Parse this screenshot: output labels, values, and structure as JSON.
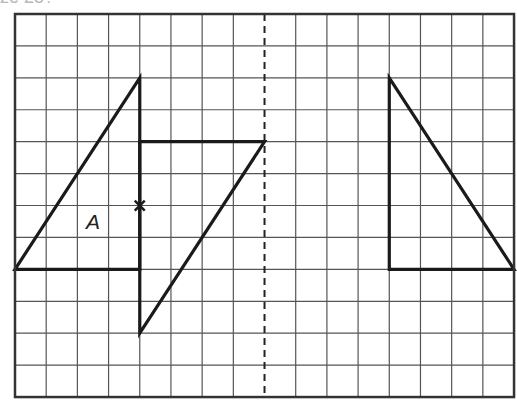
{
  "header": {
    "cropped_text": "ze 25?"
  },
  "grid": {
    "origin": [
      15,
      14
    ],
    "cols": 16,
    "rows": 12,
    "cell_w": 31.19,
    "cell_h": 31.92,
    "line_color": "#555555",
    "border_color": "#333333"
  },
  "mirror_line": {
    "col": 8,
    "style": "dashed",
    "color": "#222222"
  },
  "shapes": [
    {
      "id": "triangle-a",
      "points": [
        [
          0,
          8
        ],
        [
          4,
          2
        ],
        [
          4,
          8
        ]
      ],
      "closed": true
    },
    {
      "id": "image-triangle",
      "points": [
        [
          4,
          4
        ],
        [
          8,
          4
        ],
        [
          4,
          10
        ]
      ],
      "closed": true
    },
    {
      "id": "reflected-triangle",
      "points": [
        [
          12,
          2
        ],
        [
          12,
          8
        ],
        [
          16,
          8
        ]
      ],
      "closed": true
    }
  ],
  "marker": {
    "type": "cross",
    "at": [
      4,
      6
    ]
  },
  "labels": [
    {
      "text": "A",
      "at": [
        2.5,
        6.75
      ]
    }
  ],
  "stroke_color": "#1a1a1a"
}
